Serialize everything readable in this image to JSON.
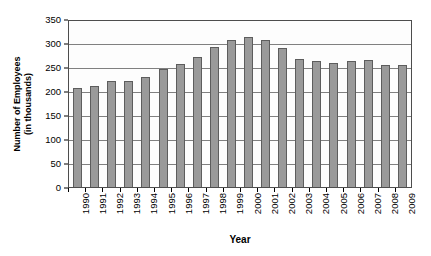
{
  "chart_data": {
    "type": "bar",
    "title": "",
    "xlabel": "Year",
    "ylabel": "Number of Employees (in thousands)",
    "ylabel_lines": [
      "Number of Employees",
      "(in thousands)"
    ],
    "categories": [
      "1990",
      "1991",
      "1992",
      "1993",
      "1994",
      "1995",
      "1996",
      "1997",
      "1998",
      "1999",
      "2000",
      "2001",
      "2002",
      "2003",
      "2004",
      "2005",
      "2006",
      "2007",
      "2008",
      "2009"
    ],
    "values": [
      208,
      213,
      224,
      224,
      232,
      249,
      259,
      275,
      296,
      311,
      317,
      311,
      294,
      270,
      265,
      262,
      265,
      267,
      257,
      257
    ],
    "ylim": [
      0,
      350
    ],
    "yticks": [
      0,
      50,
      100,
      150,
      200,
      250,
      300,
      350
    ],
    "ytick_labels": [
      "0",
      "50",
      "100",
      "150",
      "200",
      "250",
      "300",
      "350"
    ],
    "grid": true,
    "grid_axis": "y",
    "legend": false,
    "legend_position": "none",
    "bar_color": "#9a9a9a",
    "bar_border_color": "#5d5d5d",
    "grid_color": "#808080",
    "axis_color": "#4d4d4d",
    "plot_background": "#fdfdfd",
    "xtick_rotation": -90
  }
}
